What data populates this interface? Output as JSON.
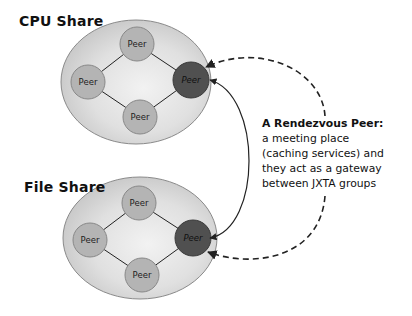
{
  "groups": [
    {
      "label": "CPU Share",
      "peers": [
        "Peer",
        "Peer",
        "Peer",
        "Peer"
      ],
      "rendezvous_label": "Peer"
    },
    {
      "label": "File Share",
      "peers": [
        "Peer",
        "Peer",
        "Peer",
        "Peer"
      ],
      "rendezvous_label": "Peer"
    }
  ],
  "note": {
    "title": "A Rendezvous Peer:",
    "lines": [
      "a meeting place",
      "(caching services) and",
      "they act as a gateway",
      "between JXTA groups"
    ]
  },
  "colors": {
    "ellipse_fill_outer": "#c8c8c8",
    "ellipse_fill_inner": "#ececec",
    "peer_fill": "#b4b4b4",
    "rendezvous_fill": "#505050",
    "line": "#222222"
  }
}
